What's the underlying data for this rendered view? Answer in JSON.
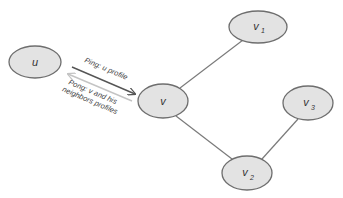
{
  "diagram": {
    "type": "network-graph",
    "colors": {
      "node_fill": "#e3e3e3",
      "node_stroke": "#6e6e6e",
      "edge": "#7a7a7a",
      "ping_arrow": "#555555",
      "pong_arrow": "#c4c4c4"
    },
    "nodes": [
      {
        "id": "u",
        "label": "u",
        "sub": "",
        "cx": 35,
        "cy": 62,
        "rx": 26,
        "ry": 16
      },
      {
        "id": "v",
        "label": "v",
        "sub": "",
        "cx": 163,
        "cy": 101,
        "rx": 25,
        "ry": 17
      },
      {
        "id": "v1",
        "label": "v",
        "sub": "1",
        "cx": 258,
        "cy": 27,
        "rx": 29,
        "ry": 16
      },
      {
        "id": "v2",
        "label": "v",
        "sub": "2",
        "cx": 247,
        "cy": 173,
        "rx": 25,
        "ry": 17
      },
      {
        "id": "v3",
        "label": "v",
        "sub": "3",
        "cx": 308,
        "cy": 103,
        "rx": 25,
        "ry": 17
      }
    ],
    "edges": [
      {
        "from": "v",
        "to": "v1"
      },
      {
        "from": "v",
        "to": "v2"
      },
      {
        "from": "v2",
        "to": "v3"
      }
    ],
    "messages": [
      {
        "id": "ping",
        "label_lines": [
          "Ping: u profile"
        ],
        "direction": "u-to-v"
      },
      {
        "id": "pong",
        "label_lines": [
          "Pong: v and his",
          "neighbors profiles"
        ],
        "direction": "v-to-u"
      }
    ]
  }
}
